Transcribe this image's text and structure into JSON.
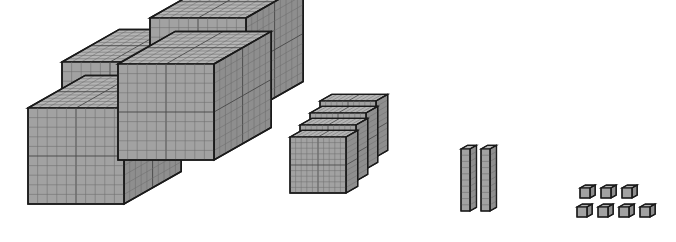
{
  "scene": {
    "title": "Base-ten blocks place-value model",
    "background_color": "#ffffff",
    "width": 676,
    "height": 242,
    "represented_number": "4427"
  },
  "palette": {
    "front_face": "#a2a2a2",
    "top_face": "#b4b4b4",
    "side_face": "#8e8e8e",
    "grid_line": "#6e6e6e",
    "grid_line_major": "#4a4a4a",
    "outline": "#1a1a1a",
    "background": "#ffffff"
  },
  "groups": [
    {
      "name": "thousands-cubes",
      "label": "thousand cubes",
      "count": 4,
      "unit_value": 1000,
      "group_value": 4000,
      "shape": "cube",
      "divisions": "10 x 10 x 10",
      "arrangement": "2 by 2 stacked grid",
      "blocks": [
        {
          "id": "cube-back-left",
          "x": 62,
          "y": 62,
          "size": 96,
          "depth": 44,
          "order": 1
        },
        {
          "id": "cube-back-right",
          "x": 150,
          "y": 18,
          "size": 96,
          "depth": 44,
          "order": 2
        },
        {
          "id": "cube-front-left",
          "x": 28,
          "y": 108,
          "size": 96,
          "depth": 44,
          "order": 3
        },
        {
          "id": "cube-front-right",
          "x": 118,
          "y": 64,
          "size": 96,
          "depth": 44,
          "order": 4
        }
      ]
    },
    {
      "name": "hundreds-flats",
      "label": "hundred flats",
      "count": 4,
      "unit_value": 100,
      "group_value": 400,
      "shape": "flat",
      "divisions": "10 x 10 x 1",
      "arrangement": "stacked back to front, offset diagonally",
      "blocks": [
        {
          "id": "flat-4",
          "x": 320,
          "y": 101,
          "size": 56,
          "depth": 9,
          "order": 1
        },
        {
          "id": "flat-3",
          "x": 310,
          "y": 113,
          "size": 56,
          "depth": 9,
          "order": 2
        },
        {
          "id": "flat-2",
          "x": 300,
          "y": 125,
          "size": 56,
          "depth": 9,
          "order": 3
        },
        {
          "id": "flat-1",
          "x": 290,
          "y": 137,
          "size": 56,
          "depth": 9,
          "order": 4
        }
      ]
    },
    {
      "name": "tens-rods",
      "label": "ten rods",
      "count": 2,
      "unit_value": 10,
      "group_value": 20,
      "shape": "rod",
      "divisions": "1 x 10 x 1",
      "arrangement": "two vertical rods side by side",
      "blocks": [
        {
          "id": "rod-1",
          "x": 461,
          "y": 149,
          "width": 9,
          "height": 62,
          "depth": 5,
          "order": 1
        },
        {
          "id": "rod-2",
          "x": 481,
          "y": 149,
          "width": 9,
          "height": 62,
          "depth": 5,
          "order": 2
        }
      ]
    },
    {
      "name": "ones-units",
      "label": "unit cubes",
      "count": 7,
      "unit_value": 1,
      "group_value": 7,
      "shape": "unit",
      "divisions": "1 x 1 x 1",
      "arrangement": "three in top row, four in bottom row",
      "blocks": [
        {
          "id": "unit-1",
          "x": 580,
          "y": 188,
          "size": 10,
          "depth": 4,
          "row": "top",
          "order": 1
        },
        {
          "id": "unit-2",
          "x": 601,
          "y": 188,
          "size": 10,
          "depth": 4,
          "row": "top",
          "order": 2
        },
        {
          "id": "unit-3",
          "x": 622,
          "y": 188,
          "size": 10,
          "depth": 4,
          "row": "top",
          "order": 3
        },
        {
          "id": "unit-4",
          "x": 577,
          "y": 207,
          "size": 10,
          "depth": 4,
          "row": "bottom",
          "order": 4
        },
        {
          "id": "unit-5",
          "x": 598,
          "y": 207,
          "size": 10,
          "depth": 4,
          "row": "bottom",
          "order": 5
        },
        {
          "id": "unit-6",
          "x": 619,
          "y": 207,
          "size": 10,
          "depth": 4,
          "row": "bottom",
          "order": 6
        },
        {
          "id": "unit-7",
          "x": 640,
          "y": 207,
          "size": 10,
          "depth": 4,
          "row": "bottom",
          "order": 7
        }
      ]
    }
  ]
}
